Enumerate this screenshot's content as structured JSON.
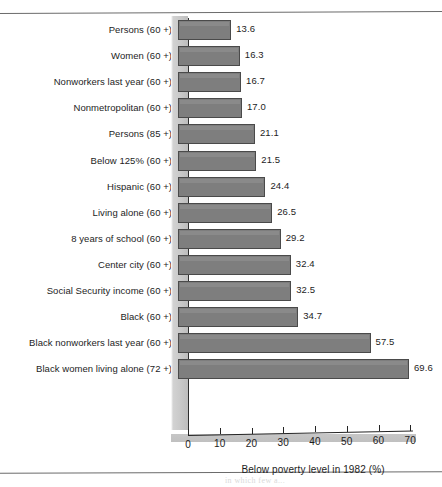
{
  "figure": {
    "bleed_text": "in which few a... "
  },
  "chart_data": {
    "type": "bar",
    "orientation": "horizontal",
    "title": "",
    "subtitle": "",
    "xlabel": "Below poverty level in 1982 (%)",
    "ylabel": "",
    "xlim": [
      0,
      70
    ],
    "grid": false,
    "legend": null,
    "tick_labels": [
      "0",
      "10",
      "20",
      "30",
      "40",
      "50",
      "60",
      "70"
    ],
    "ticks": [
      0,
      10,
      20,
      30,
      40,
      50,
      60,
      70
    ],
    "categories": [
      "Persons (60 +)",
      "Women (60 +)",
      "Nonworkers last year (60 +)",
      "Nonmetropolitan (60 +)",
      "Persons (85 +)",
      "Below 125% (60 +)",
      "Hispanic (60 +)",
      "Living alone (60 +)",
      "8 years of school (60 +)",
      "Center city (60 +)",
      "Social Security income (60 +)",
      "Black (60 +)",
      "Black nonworkers last year (60 +)",
      "Black women living alone (72 +)"
    ],
    "values": [
      13.6,
      16.3,
      16.7,
      17.0,
      21.1,
      21.5,
      24.4,
      26.5,
      29.2,
      32.4,
      32.5,
      34.7,
      57.5,
      69.6
    ],
    "value_labels": [
      "13.6",
      "16.3",
      "16.7",
      "17.0",
      "21.1",
      "21.5",
      "24.4",
      "26.5",
      "29.2",
      "32.4",
      "32.5",
      "34.7",
      "57.5",
      "69.6"
    ],
    "bar_color": "#7e7e7e",
    "bar_edge_color": "#4a4a4a",
    "background_color": "#ffffff"
  }
}
